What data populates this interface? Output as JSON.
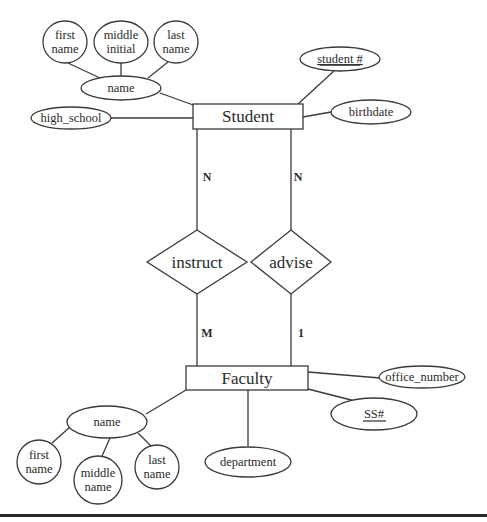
{
  "diagram": {
    "type": "ER diagram",
    "entities": {
      "student": {
        "label": "Student"
      },
      "faculty": {
        "label": "Faculty"
      }
    },
    "relationships": {
      "instruct": {
        "label": "instruct",
        "student_cardinality": "N",
        "faculty_cardinality": "M"
      },
      "advise": {
        "label": "advise",
        "student_cardinality": "N",
        "faculty_cardinality": "1"
      }
    },
    "student_attributes": {
      "name": "name",
      "first_name": [
        "first",
        "name"
      ],
      "middle_initial": [
        "middle",
        "initial"
      ],
      "last_name": [
        "last",
        "name"
      ],
      "high_school": "high_school",
      "student_number": "student #",
      "birthdate": "birthdate"
    },
    "faculty_attributes": {
      "name": "name",
      "first_name": [
        "first",
        "name"
      ],
      "middle_name": [
        "middle",
        "name"
      ],
      "last_name": [
        "last",
        "name"
      ],
      "department": "department",
      "office_number": "office_number",
      "ss_number": "SS#"
    },
    "key_attributes": [
      "student #",
      "SS#"
    ],
    "colors": {
      "stroke": "#3a3a3a",
      "text": "#2a2a2a",
      "background": "#ffffff",
      "rule": "#2a2a2a"
    }
  }
}
